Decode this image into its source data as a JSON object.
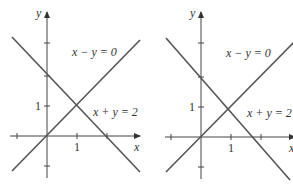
{
  "panels": [
    {
      "id": "left",
      "origin": [
        47,
        136
      ],
      "unit": 30,
      "axis_labels": {
        "x": "x",
        "y": "y"
      },
      "tick_label_x": "1",
      "tick_label_y": "1",
      "line1_label": "x − y = 0",
      "line2_label": "x + y = 2"
    },
    {
      "id": "right",
      "origin": [
        201,
        137
      ],
      "unit": 30,
      "axis_labels": {
        "x": "x",
        "y": "y"
      },
      "tick_label_x": "1",
      "tick_label_y": "1",
      "line1_label": "x − y = 0",
      "line2_label": "x + y = 2"
    }
  ],
  "colors": {
    "axis": "#444444",
    "line": "#555555",
    "text": "#333333"
  }
}
